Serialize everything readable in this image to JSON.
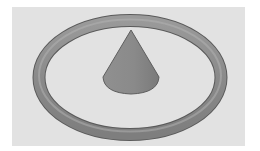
{
  "scene": {
    "description": "3D render of a cone centered inside a torus ring on a light gray background",
    "objects": [
      {
        "name": "torus",
        "shape": "ring",
        "color": "#8f8f8f"
      },
      {
        "name": "cone",
        "shape": "cone",
        "color": "#8a8a8a"
      }
    ],
    "colors": {
      "page_background": "#ffffff",
      "panel_background": "#e2e2e2",
      "object_dark": "#5e5e5e",
      "object_mid": "#8c8c8c",
      "object_light": "#b0b0b0"
    }
  }
}
